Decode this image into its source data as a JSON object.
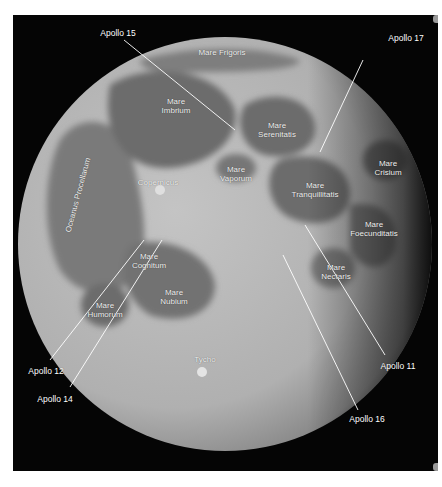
{
  "image": {
    "subject": "Full Moon map with maria and Apollo landing sites",
    "background_color": "#050505",
    "page_background": "#ffffff"
  },
  "maria": [
    {
      "id": "frigoris",
      "lines": [
        "Mare Frigoris"
      ],
      "x": 222,
      "y": 52
    },
    {
      "id": "imbrium",
      "lines": [
        "Mare",
        "Imbrium"
      ],
      "x": 176,
      "y": 106
    },
    {
      "id": "serenitatis",
      "lines": [
        "Mare",
        "Serenitatis"
      ],
      "x": 277,
      "y": 130
    },
    {
      "id": "vaporum",
      "lines": [
        "Mare",
        "Vaporum"
      ],
      "x": 236,
      "y": 170
    },
    {
      "id": "crisium",
      "lines": [
        "Mare",
        "Crisium"
      ],
      "x": 388,
      "y": 168
    },
    {
      "id": "tranquillitatis",
      "lines": [
        "Mare",
        "Tranquillitatis"
      ],
      "x": 315,
      "y": 190
    },
    {
      "id": "foecunditatis",
      "lines": [
        "Mare",
        "Foecunditatis"
      ],
      "x": 374,
      "y": 229
    },
    {
      "id": "cognitum",
      "lines": [
        "Mare",
        "Cognitum"
      ],
      "x": 149,
      "y": 261
    },
    {
      "id": "nectaris",
      "lines": [
        "Mare",
        "Nectaris"
      ],
      "x": 336,
      "y": 272
    },
    {
      "id": "humorum",
      "lines": [
        "Mare",
        "Humorum"
      ],
      "x": 105,
      "y": 310
    },
    {
      "id": "nubium",
      "lines": [
        "Mare",
        "Nubium"
      ],
      "x": 174,
      "y": 297
    }
  ],
  "features": [
    {
      "id": "copernicus",
      "label": "Copernicus",
      "x": 158,
      "y": 182
    },
    {
      "id": "tycho",
      "label": "Tycho",
      "x": 205,
      "y": 359
    },
    {
      "id": "oceanus-procellarum",
      "label": "Oceanus Procellarum",
      "x": 78,
      "y": 195,
      "rotation": -75
    }
  ],
  "apollo_sites": [
    {
      "id": "apollo-15",
      "label": "Apollo 15",
      "label_x": 118,
      "label_y": 33,
      "line": [
        124,
        40,
        235,
        130
      ]
    },
    {
      "id": "apollo-17",
      "label": "Apollo 17",
      "label_x": 406,
      "label_y": 38,
      "line": [
        363,
        60,
        320,
        152
      ]
    },
    {
      "id": "apollo-12",
      "label": "Apollo 12",
      "label_x": 46,
      "label_y": 371,
      "line": [
        50,
        360,
        144,
        240
      ]
    },
    {
      "id": "apollo-14",
      "label": "Apollo 14",
      "label_x": 55,
      "label_y": 399,
      "line": [
        70,
        387,
        162,
        240
      ]
    },
    {
      "id": "apollo-11",
      "label": "Apollo 11",
      "label_x": 398,
      "label_y": 366,
      "line": [
        385,
        355,
        305,
        225
      ]
    },
    {
      "id": "apollo-16",
      "label": "Apollo 16",
      "label_x": 367,
      "label_y": 419,
      "line": [
        358,
        410,
        283,
        255
      ]
    }
  ],
  "colors": {
    "label": "#f2f2f2",
    "leader_line": "#ffffff",
    "highlands": "#b8b8b8",
    "maria": "#6e6e6e"
  }
}
